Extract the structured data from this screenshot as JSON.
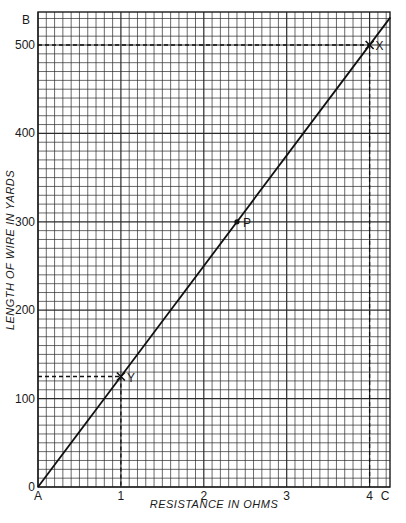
{
  "chart_data": {
    "type": "line",
    "title": "",
    "xlabel": "RESISTANCE IN OHMS",
    "ylabel": "LENGTH OF WIRE IN YARDS",
    "xlim": [
      0,
      4.25
    ],
    "ylim": [
      0,
      537
    ],
    "x_ticks": [
      0,
      1,
      2,
      3,
      4
    ],
    "x_tick_labels": [
      "",
      "1",
      "2",
      "3",
      "4"
    ],
    "y_ticks": [
      0,
      100,
      200,
      300,
      400,
      500
    ],
    "y_tick_labels": [
      "0",
      "100",
      "200",
      "300",
      "400",
      "500"
    ],
    "grid": true,
    "series": [
      {
        "name": "wire length vs resistance",
        "x": [
          0,
          4.25
        ],
        "y": [
          0,
          531.25
        ]
      }
    ],
    "points": [
      {
        "label": "Y",
        "x": 1,
        "y": 125,
        "marker": "x"
      },
      {
        "label": "P",
        "x": 2.4,
        "y": 300,
        "marker": "dot"
      },
      {
        "label": "X",
        "x": 4,
        "y": 500,
        "marker": "x"
      }
    ],
    "corner_labels": {
      "origin": "A",
      "y_axis_top": "B",
      "x_axis_end": "C"
    },
    "annotations": [
      "Dashed guide from Y to x=1 and y=125",
      "Dashed guide from X to x=4 and y=500"
    ]
  }
}
